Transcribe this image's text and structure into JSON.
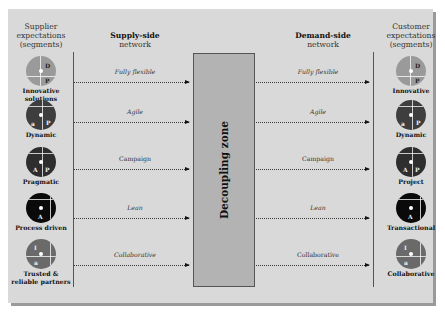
{
  "headers": {
    "supplier": "Supplier expectations (segments)",
    "supply_bold": "Supply-side",
    "supply_sub": "network",
    "demand_bold": "Demand-side",
    "demand_sub": "network",
    "customer": "Customer expectations (segments)"
  },
  "decoupling_zone": "Decoupling zone",
  "flows": [
    {
      "label": "Fully flexible",
      "italic": true
    },
    {
      "label": "Agile",
      "italic": true
    },
    {
      "label": "Campaign",
      "italic": false
    },
    {
      "label": "Lean",
      "italic": true
    },
    {
      "label": "Collaborative",
      "italic": true
    }
  ],
  "demand_flows": [
    {
      "label": "Fully flexible"
    },
    {
      "label": "Agile"
    },
    {
      "label": "Campaign"
    },
    {
      "label": "Lean"
    },
    {
      "label": "Collaborative"
    }
  ],
  "supplier_segments": [
    {
      "label": "Innovative solutions",
      "color": "#9a9a9a",
      "letters": [
        "D",
        "P"
      ]
    },
    {
      "label": "Dynamic",
      "color": "#3e3e3e",
      "letters": [
        "a",
        "P"
      ]
    },
    {
      "label": "Pragmatic",
      "color": "#2e2e2e",
      "letters": [
        "A",
        "P"
      ]
    },
    {
      "label": "Process driven",
      "color": "#0a0a0a",
      "letters": [
        "A"
      ]
    },
    {
      "label": "Trusted & reliable partners",
      "color": "#6a6a6a",
      "letters": [
        "I",
        "a"
      ]
    }
  ],
  "customer_segments": [
    {
      "label": "Innovative",
      "color": "#9a9a9a",
      "letters": [
        "D",
        "P"
      ]
    },
    {
      "label": "Dynamic",
      "color": "#3e3e3e",
      "letters": [
        "a",
        "P"
      ]
    },
    {
      "label": "Project",
      "color": "#2e2e2e",
      "letters": [
        "A",
        "P"
      ]
    },
    {
      "label": "Transactional",
      "color": "#0a0a0a",
      "letters": [
        "A"
      ]
    },
    {
      "label": "Collaborative",
      "color": "#6a6a6a",
      "letters": [
        "I",
        "a"
      ]
    }
  ]
}
